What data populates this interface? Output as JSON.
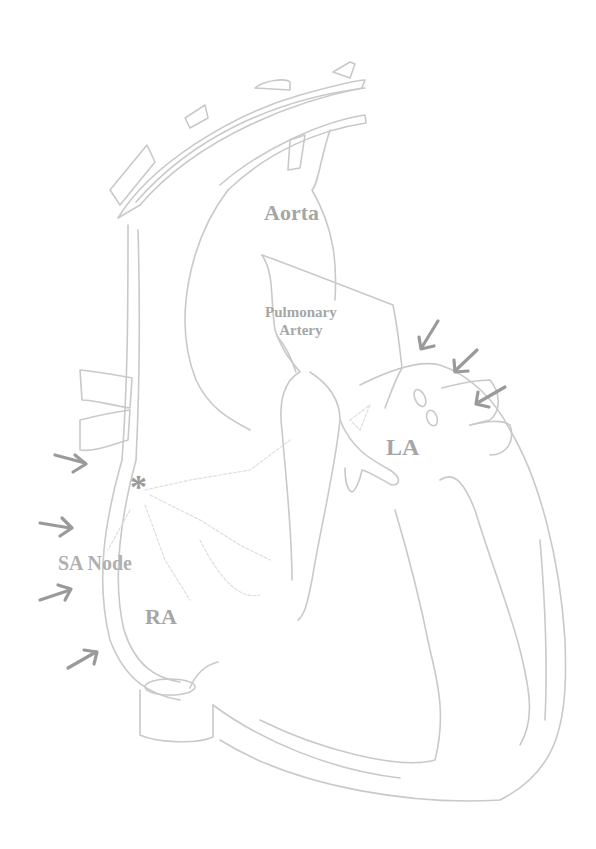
{
  "diagram": {
    "type": "anatomical heart cross-section sketch",
    "labels": {
      "aorta": "Aorta",
      "pulmonary_artery_line1": "Pulmonary",
      "pulmonary_artery_line2": "Artery",
      "left_atrium": "LA",
      "sa_node": "SA Node",
      "right_atrium": "RA",
      "sa_node_marker": "*"
    },
    "arrows": {
      "left_side_count": 4,
      "right_side_count": 3
    },
    "colors": {
      "outline": "#c9c9c9",
      "label": "#a6a6a6",
      "arrow": "#9a9a9a",
      "background": "#ffffff"
    }
  }
}
